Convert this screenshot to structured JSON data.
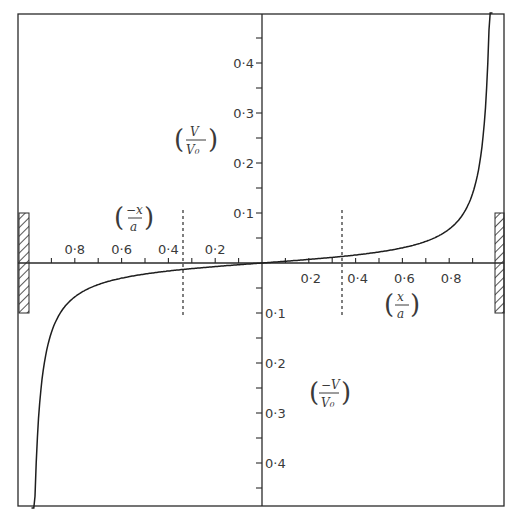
{
  "chart_data": {
    "type": "line",
    "title": "",
    "xlabel_positive": "(x/a)",
    "xlabel_negative": "(-x/a)",
    "ylabel_positive": "(V/V0)",
    "ylabel_negative": "(-V/V0)",
    "x_ticks_positive": [
      "0·2",
      "0·4",
      "0·6",
      "0·8"
    ],
    "x_ticks_negative": [
      "0·8",
      "0·6",
      "0·4",
      "0·2"
    ],
    "y_ticks_positive": [
      "0·1",
      "0·2",
      "0·3",
      "0·4"
    ],
    "y_ticks_negative": [
      "0·1",
      "0·2",
      "0·3",
      "0·4"
    ],
    "xlim": [
      -1.0,
      1.0
    ],
    "ylim": [
      -0.48,
      0.5
    ],
    "grid": false,
    "legend": "none",
    "dotted_markers_x": [
      -0.34,
      0.34
    ],
    "electrodes_x": [
      -1.0,
      1.0
    ],
    "series": [
      {
        "name": "V/V0",
        "x": [
          -0.98,
          -0.95,
          -0.9,
          -0.85,
          -0.8,
          -0.7,
          -0.6,
          -0.5,
          -0.4,
          -0.34,
          -0.3,
          -0.2,
          -0.1,
          0.0,
          0.1,
          0.2,
          0.3,
          0.34,
          0.4,
          0.5,
          0.6,
          0.7,
          0.8,
          0.85,
          0.9,
          0.95,
          0.98
        ],
        "y": [
          -0.48,
          -0.3,
          -0.19,
          -0.14,
          -0.11,
          -0.075,
          -0.055,
          -0.04,
          -0.03,
          -0.025,
          -0.022,
          -0.014,
          -0.007,
          0.0,
          0.007,
          0.014,
          0.022,
          0.025,
          0.03,
          0.04,
          0.055,
          0.075,
          0.11,
          0.14,
          0.19,
          0.3,
          0.48
        ]
      }
    ]
  },
  "labels": {
    "x_pos_num": "x",
    "x_pos_den": "a",
    "x_neg_num": "−x",
    "x_neg_den": "a",
    "y_pos_num": "V",
    "y_pos_den": "V₀",
    "y_neg_num": "−V",
    "y_neg_den": "V₀",
    "paren_open": "(",
    "paren_close": ")"
  },
  "colors": {
    "ink": "#2a2a2a",
    "background": "#ffffff"
  }
}
